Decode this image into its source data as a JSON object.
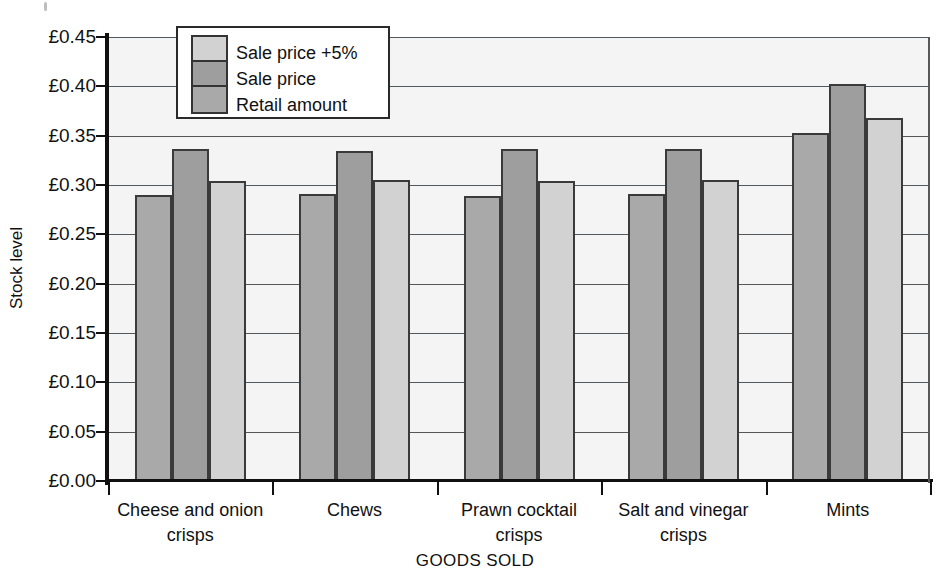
{
  "chart_data": {
    "type": "bar",
    "title": "",
    "xlabel": "GOODS SOLD",
    "ylabel": "Stock level",
    "categories": [
      "Cheese and onion crisps",
      "Chews",
      "Prawn cocktail crisps",
      "Salt and vinegar crisps",
      "Mints"
    ],
    "category_lines": [
      [
        "Cheese and onion",
        "crisps"
      ],
      [
        "Chews",
        ""
      ],
      [
        "Prawn cocktail",
        "crisps"
      ],
      [
        "Salt and vinegar",
        "crisps"
      ],
      [
        "Mints",
        ""
      ]
    ],
    "series": [
      {
        "name": "Retail amount",
        "color": "#a9a9a9",
        "values": [
          0.29,
          0.291,
          0.289,
          0.291,
          0.353
        ]
      },
      {
        "name": "Sale price",
        "color": "#9e9e9e",
        "values": [
          0.336,
          0.334,
          0.336,
          0.336,
          0.402
        ]
      },
      {
        "name": "Sale price +5%",
        "color": "#d2d2d2",
        "values": [
          0.304,
          0.305,
          0.304,
          0.305,
          0.368
        ]
      }
    ],
    "legend_order": [
      "Sale price +5%",
      "Sale price",
      "Retail amount"
    ],
    "legend_position": "top-left-inside",
    "ylim": [
      0.0,
      0.45
    ],
    "ytick_values": [
      0.0,
      0.05,
      0.1,
      0.15,
      0.2,
      0.25,
      0.3,
      0.35,
      0.4,
      0.45
    ],
    "ytick_labels": [
      "£0.00",
      "£0.05",
      "£0.10",
      "£0.15",
      "£0.20",
      "£0.25",
      "£0.30",
      "£0.35",
      "£0.40",
      "£0.45"
    ],
    "currency_symbol": "£",
    "grid": true,
    "grid_axis": "y",
    "plot_background": "#f4f4f4",
    "bar_edge_color": "#3a3a3a",
    "axis_color": "#101010"
  },
  "legend": {
    "items": [
      {
        "label": "Sale price +5%",
        "color": "#d2d2d2"
      },
      {
        "label": "Sale price",
        "color": "#9e9e9e"
      },
      {
        "label": "Retail amount",
        "color": "#a9a9a9"
      }
    ]
  },
  "axes": {
    "y_title": "Stock level",
    "x_title": "GOODS SOLD"
  }
}
